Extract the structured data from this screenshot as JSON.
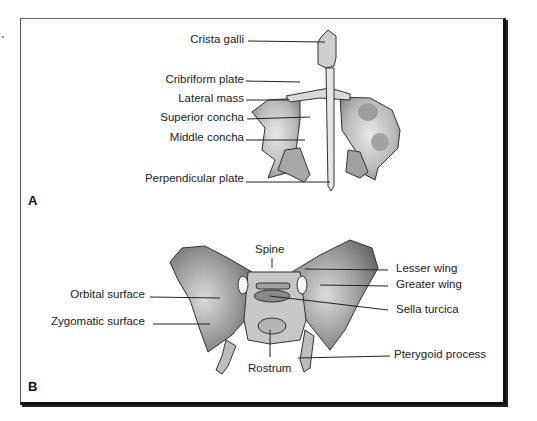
{
  "figure": {
    "panels": [
      {
        "letter": "A",
        "subject": "ethmoid bone (anterior view)",
        "labels": [
          {
            "text": "Crista galli"
          },
          {
            "text": "Cribriform plate"
          },
          {
            "text": "Lateral mass"
          },
          {
            "text": "Superior concha"
          },
          {
            "text": "Middle concha"
          },
          {
            "text": "Perpendicular plate"
          }
        ]
      },
      {
        "letter": "B",
        "subject": "sphenoid bone (anterior view)",
        "labels_left": [
          {
            "text": "Orbital surface"
          },
          {
            "text": "Zygomatic surface"
          }
        ],
        "labels_center": [
          {
            "text": "Spine"
          },
          {
            "text": "Rostrum"
          }
        ],
        "labels_right": [
          {
            "text": "Lesser wing"
          },
          {
            "text": "Greater wing"
          },
          {
            "text": "Sella turcica"
          },
          {
            "text": "Pterygoid process"
          }
        ]
      }
    ]
  }
}
